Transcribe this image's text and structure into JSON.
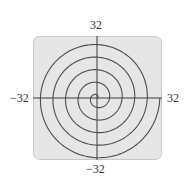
{
  "chart_data": {
    "type": "line",
    "subtype": "polar-spiral",
    "title": "",
    "equation": "r = θ",
    "theta_range": [
      0,
      31.4159
    ],
    "xlabel": "",
    "ylabel": "",
    "xlim": [
      -32,
      32
    ],
    "ylim": [
      -32,
      32
    ],
    "tick_labels": {
      "top": "32",
      "bottom": "−32",
      "left": "−32",
      "right": "32"
    },
    "grid": false,
    "legend": null,
    "axis_crossings_positive_x": [
      6.28,
      12.57,
      18.85,
      25.13,
      31.42
    ],
    "colors": {
      "background": "#e6e6e6",
      "border": "#c8c8c8",
      "curve": "#4a4a4a",
      "axes": "#3a3a3a"
    }
  }
}
